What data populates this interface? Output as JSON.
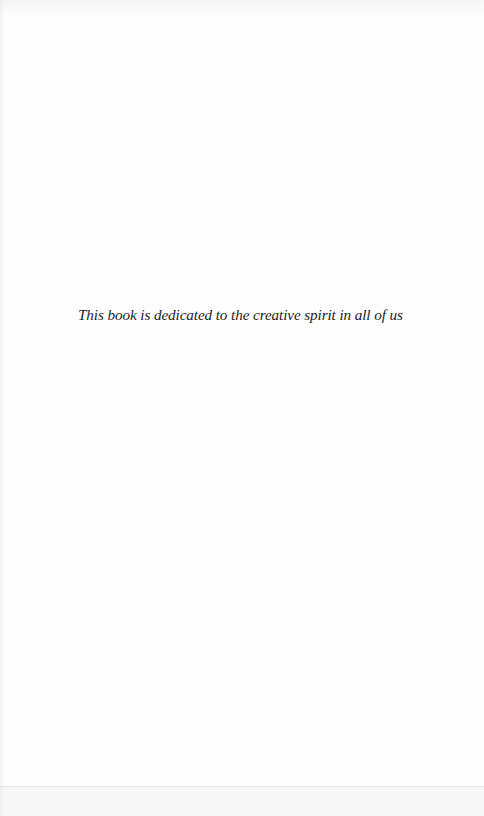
{
  "page": {
    "type": "dedication-page",
    "dedication_text": "This book is dedicated to the creative spirit in all of us"
  },
  "colors": {
    "paper": "#fdfdfd",
    "text": "#1e1e1e"
  }
}
